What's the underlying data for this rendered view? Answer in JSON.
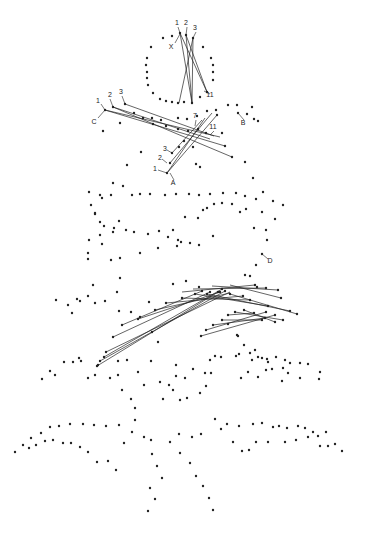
{
  "diagram": {
    "title": "",
    "width": 371,
    "height": 537,
    "colors": {
      "ink": "#222222",
      "background": "#ffffff"
    },
    "labels": [
      {
        "id": "label-1-top",
        "text": "1",
        "x": 177,
        "y": 25
      },
      {
        "id": "label-2-top",
        "text": "2",
        "x": 186,
        "y": 25
      },
      {
        "id": "label-3-top",
        "text": "3",
        "x": 195,
        "y": 30
      },
      {
        "id": "label-X",
        "text": "X",
        "x": 171,
        "y": 49
      },
      {
        "id": "label-11-top",
        "text": "11",
        "x": 210,
        "y": 97
      },
      {
        "id": "label-1-C",
        "text": "1",
        "x": 98,
        "y": 103
      },
      {
        "id": "label-2-C",
        "text": "2",
        "x": 110,
        "y": 97
      },
      {
        "id": "label-3-C",
        "text": "3",
        "x": 121,
        "y": 94
      },
      {
        "id": "label-C",
        "text": "C",
        "x": 94,
        "y": 124
      },
      {
        "id": "label-B",
        "text": "B",
        "x": 243,
        "y": 125
      },
      {
        "id": "label-7",
        "text": "7",
        "x": 195,
        "y": 118
      },
      {
        "id": "label-11-mid",
        "text": "11",
        "x": 213,
        "y": 129
      },
      {
        "id": "label-3-A",
        "text": "3",
        "x": 165,
        "y": 151
      },
      {
        "id": "label-2-A",
        "text": "2",
        "x": 160,
        "y": 160
      },
      {
        "id": "label-1-A",
        "text": "1",
        "x": 155,
        "y": 171
      },
      {
        "id": "label-A",
        "text": "A",
        "x": 173,
        "y": 185
      },
      {
        "id": "label-D",
        "text": "D",
        "x": 270,
        "y": 263
      }
    ],
    "leaders": [
      [
        178,
        27,
        180,
        33
      ],
      [
        187,
        27,
        186,
        35
      ],
      [
        196,
        32,
        193,
        38
      ],
      [
        175,
        43,
        180,
        34
      ],
      [
        210,
        94,
        204,
        91
      ],
      [
        101,
        104,
        105,
        110
      ],
      [
        110,
        99,
        113,
        107
      ],
      [
        122,
        96,
        125,
        104
      ],
      [
        98,
        118,
        105,
        110
      ],
      [
        244,
        120,
        238,
        113
      ],
      [
        196,
        120,
        195,
        126
      ],
      [
        214,
        131,
        210,
        135
      ],
      [
        167,
        150,
        172,
        153
      ],
      [
        162,
        159,
        167,
        163
      ],
      [
        158,
        170,
        167,
        173
      ],
      [
        174,
        180,
        170,
        173
      ],
      [
        268,
        259,
        262,
        254
      ]
    ],
    "threads": [
      [
        180,
        33,
        207,
        92
      ],
      [
        180,
        33,
        192,
        103
      ],
      [
        186,
        35,
        192,
        103
      ],
      [
        193,
        38,
        192,
        103
      ],
      [
        186,
        35,
        207,
        92
      ],
      [
        193,
        38,
        179,
        103
      ],
      [
        105,
        110,
        225,
        146
      ],
      [
        113,
        107,
        232,
        157
      ],
      [
        125,
        104,
        214,
        136
      ],
      [
        105,
        110,
        220,
        137
      ],
      [
        113,
        107,
        210,
        139
      ],
      [
        167,
        173,
        217,
        115
      ],
      [
        167,
        173,
        205,
        118
      ],
      [
        170,
        163,
        212,
        113
      ],
      [
        172,
        153,
        202,
        120
      ],
      [
        97,
        366,
        218,
        292
      ],
      [
        100,
        361,
        225,
        291
      ],
      [
        104,
        357,
        222,
        289
      ],
      [
        106,
        352,
        230,
        292
      ],
      [
        113,
        337,
        210,
        292
      ],
      [
        122,
        325,
        202,
        291
      ],
      [
        138,
        319,
        220,
        292
      ],
      [
        155,
        310,
        230,
        293
      ],
      [
        166,
        303,
        243,
        296
      ],
      [
        182,
        298,
        250,
        300
      ],
      [
        195,
        294,
        268,
        306
      ],
      [
        207,
        294,
        290,
        311
      ],
      [
        230,
        294,
        297,
        314
      ],
      [
        182,
        292,
        255,
        285
      ],
      [
        193,
        289,
        266,
        288
      ],
      [
        212,
        286,
        278,
        290
      ],
      [
        230,
        285,
        281,
        298
      ],
      [
        201,
        336,
        275,
        315
      ],
      [
        206,
        330,
        266,
        312
      ],
      [
        213,
        325,
        265,
        318
      ],
      [
        222,
        320,
        262,
        320
      ],
      [
        228,
        315,
        254,
        313
      ],
      [
        235,
        312,
        283,
        320
      ],
      [
        244,
        310,
        275,
        322
      ]
    ],
    "dots": [
      [
        180,
        33
      ],
      [
        186,
        35
      ],
      [
        193,
        38
      ],
      [
        163,
        38
      ],
      [
        172,
        36
      ],
      [
        203,
        47
      ],
      [
        151,
        47
      ],
      [
        147,
        58
      ],
      [
        146,
        65
      ],
      [
        147,
        72
      ],
      [
        147,
        78
      ],
      [
        148,
        85
      ],
      [
        211,
        58
      ],
      [
        213,
        65
      ],
      [
        213,
        72
      ],
      [
        213,
        80
      ],
      [
        153,
        93
      ],
      [
        160,
        99
      ],
      [
        166,
        101
      ],
      [
        172,
        102
      ],
      [
        178,
        103
      ],
      [
        184,
        102
      ],
      [
        192,
        103
      ],
      [
        200,
        97
      ],
      [
        207,
        92
      ],
      [
        105,
        110
      ],
      [
        113,
        107
      ],
      [
        125,
        104
      ],
      [
        134,
        113
      ],
      [
        143,
        118
      ],
      [
        152,
        118
      ],
      [
        161,
        120
      ],
      [
        178,
        118
      ],
      [
        187,
        119
      ],
      [
        197,
        116
      ],
      [
        207,
        111
      ],
      [
        216,
        110
      ],
      [
        228,
        105
      ],
      [
        238,
        113
      ],
      [
        247,
        114
      ],
      [
        254,
        119
      ],
      [
        258,
        121
      ],
      [
        237,
        105
      ],
      [
        252,
        107
      ],
      [
        153,
        124
      ],
      [
        166,
        126
      ],
      [
        188,
        131
      ],
      [
        198,
        129
      ],
      [
        217,
        115
      ],
      [
        225,
        146
      ],
      [
        232,
        157
      ],
      [
        120,
        123
      ],
      [
        103,
        131
      ],
      [
        178,
        129
      ],
      [
        206,
        133
      ],
      [
        222,
        133
      ],
      [
        141,
        152
      ],
      [
        127,
        165
      ],
      [
        113,
        183
      ],
      [
        102,
        198
      ],
      [
        95,
        214
      ],
      [
        245,
        162
      ],
      [
        253,
        178
      ],
      [
        263,
        192
      ],
      [
        167,
        173
      ],
      [
        170,
        163
      ],
      [
        172,
        153
      ],
      [
        179,
        147
      ],
      [
        184,
        141
      ],
      [
        193,
        147
      ],
      [
        196,
        164
      ],
      [
        200,
        167
      ],
      [
        123,
        186
      ],
      [
        89,
        192
      ],
      [
        91,
        205
      ],
      [
        100,
        195
      ],
      [
        111,
        195
      ],
      [
        132,
        195
      ],
      [
        140,
        194
      ],
      [
        150,
        194
      ],
      [
        165,
        195
      ],
      [
        176,
        194
      ],
      [
        189,
        194
      ],
      [
        199,
        195
      ],
      [
        210,
        194
      ],
      [
        223,
        193
      ],
      [
        236,
        193
      ],
      [
        245,
        196
      ],
      [
        256,
        199
      ],
      [
        273,
        201
      ],
      [
        283,
        205
      ],
      [
        95,
        213
      ],
      [
        119,
        221
      ],
      [
        114,
        228
      ],
      [
        100,
        222
      ],
      [
        104,
        226
      ],
      [
        113,
        232
      ],
      [
        126,
        230
      ],
      [
        134,
        232
      ],
      [
        148,
        234
      ],
      [
        159,
        231
      ],
      [
        168,
        237
      ],
      [
        181,
        242
      ],
      [
        185,
        217
      ],
      [
        198,
        218
      ],
      [
        203,
        210
      ],
      [
        207,
        208
      ],
      [
        214,
        204
      ],
      [
        222,
        203
      ],
      [
        232,
        204
      ],
      [
        240,
        212
      ],
      [
        246,
        209
      ],
      [
        213,
        236
      ],
      [
        199,
        245
      ],
      [
        190,
        243
      ],
      [
        178,
        240
      ],
      [
        173,
        230
      ],
      [
        262,
        212
      ],
      [
        266,
        230
      ],
      [
        267,
        240
      ],
      [
        254,
        228
      ],
      [
        275,
        219
      ],
      [
        100,
        235
      ],
      [
        102,
        244
      ],
      [
        111,
        260
      ],
      [
        120,
        258
      ],
      [
        140,
        253
      ],
      [
        158,
        248
      ],
      [
        177,
        246
      ],
      [
        89,
        240
      ],
      [
        88,
        253
      ],
      [
        88,
        259
      ],
      [
        262,
        254
      ],
      [
        256,
        265
      ],
      [
        250,
        276
      ],
      [
        245,
        275
      ],
      [
        257,
        287
      ],
      [
        119,
        311
      ],
      [
        131,
        312
      ],
      [
        140,
        317
      ],
      [
        149,
        302
      ],
      [
        173,
        284
      ],
      [
        186,
        281
      ],
      [
        199,
        287
      ],
      [
        120,
        278
      ],
      [
        93,
        285
      ],
      [
        88,
        296
      ],
      [
        77,
        299
      ],
      [
        72,
        313
      ],
      [
        80,
        301
      ],
      [
        56,
        300
      ],
      [
        68,
        305
      ],
      [
        105,
        301
      ],
      [
        117,
        292
      ],
      [
        95,
        303
      ],
      [
        97,
        366
      ],
      [
        100,
        361
      ],
      [
        104,
        357
      ],
      [
        106,
        352
      ],
      [
        113,
        337
      ],
      [
        122,
        325
      ],
      [
        138,
        319
      ],
      [
        155,
        310
      ],
      [
        166,
        303
      ],
      [
        182,
        298
      ],
      [
        195,
        294
      ],
      [
        207,
        294
      ],
      [
        230,
        294
      ],
      [
        218,
        292
      ],
      [
        225,
        291
      ],
      [
        222,
        289
      ],
      [
        210,
        292
      ],
      [
        202,
        291
      ],
      [
        220,
        292
      ],
      [
        243,
        296
      ],
      [
        250,
        300
      ],
      [
        268,
        306
      ],
      [
        290,
        311
      ],
      [
        297,
        314
      ],
      [
        255,
        285
      ],
      [
        266,
        288
      ],
      [
        278,
        290
      ],
      [
        281,
        298
      ],
      [
        201,
        336
      ],
      [
        206,
        330
      ],
      [
        213,
        325
      ],
      [
        222,
        320
      ],
      [
        228,
        315
      ],
      [
        235,
        312
      ],
      [
        244,
        310
      ],
      [
        275,
        315
      ],
      [
        266,
        312
      ],
      [
        265,
        318
      ],
      [
        262,
        320
      ],
      [
        254,
        313
      ],
      [
        283,
        320
      ],
      [
        275,
        322
      ],
      [
        152,
        332
      ],
      [
        158,
        342
      ],
      [
        228,
        324
      ],
      [
        237,
        335
      ],
      [
        244,
        345
      ],
      [
        250,
        353
      ],
      [
        252,
        360
      ],
      [
        255,
        350
      ],
      [
        239,
        354
      ],
      [
        262,
        358
      ],
      [
        238,
        336
      ],
      [
        258,
        377
      ],
      [
        285,
        360
      ],
      [
        267,
        359
      ],
      [
        276,
        357
      ],
      [
        290,
        363
      ],
      [
        288,
        373
      ],
      [
        300,
        363
      ],
      [
        308,
        364
      ],
      [
        319,
        379
      ],
      [
        88,
        378
      ],
      [
        98,
        365
      ],
      [
        118,
        361
      ],
      [
        127,
        360
      ],
      [
        151,
        361
      ],
      [
        176,
        365
      ],
      [
        205,
        373
      ],
      [
        42,
        379
      ],
      [
        50,
        371
      ],
      [
        55,
        375
      ],
      [
        64,
        362
      ],
      [
        73,
        362
      ],
      [
        81,
        361
      ],
      [
        95,
        375
      ],
      [
        118,
        375
      ],
      [
        138,
        372
      ],
      [
        110,
        378
      ],
      [
        122,
        390
      ],
      [
        131,
        399
      ],
      [
        135,
        408
      ],
      [
        79,
        358
      ],
      [
        144,
        385
      ],
      [
        160,
        382
      ],
      [
        173,
        390
      ],
      [
        180,
        400
      ],
      [
        163,
        399
      ],
      [
        169,
        385
      ],
      [
        176,
        376
      ],
      [
        185,
        378
      ],
      [
        193,
        369
      ],
      [
        210,
        360
      ],
      [
        221,
        357
      ],
      [
        236,
        356
      ],
      [
        258,
        357
      ],
      [
        268,
        362
      ],
      [
        272,
        369
      ],
      [
        187,
        398
      ],
      [
        200,
        393
      ],
      [
        206,
        386
      ],
      [
        211,
        373
      ],
      [
        215,
        356
      ],
      [
        241,
        378
      ],
      [
        248,
        372
      ],
      [
        266,
        370
      ],
      [
        283,
        368
      ],
      [
        282,
        381
      ],
      [
        300,
        378
      ],
      [
        320,
        372
      ],
      [
        15,
        452
      ],
      [
        23,
        445
      ],
      [
        29,
        448
      ],
      [
        31,
        438
      ],
      [
        36,
        445
      ],
      [
        41,
        433
      ],
      [
        45,
        441
      ],
      [
        50,
        427
      ],
      [
        53,
        440
      ],
      [
        59,
        426
      ],
      [
        63,
        443
      ],
      [
        70,
        424
      ],
      [
        71,
        443
      ],
      [
        83,
        424
      ],
      [
        80,
        447
      ],
      [
        94,
        425
      ],
      [
        88,
        452
      ],
      [
        106,
        426
      ],
      [
        97,
        462
      ],
      [
        108,
        461
      ],
      [
        116,
        470
      ],
      [
        119,
        425
      ],
      [
        124,
        443
      ],
      [
        132,
        432
      ],
      [
        135,
        420
      ],
      [
        144,
        437
      ],
      [
        151,
        440
      ],
      [
        152,
        454
      ],
      [
        157,
        466
      ],
      [
        162,
        478
      ],
      [
        150,
        488
      ],
      [
        155,
        499
      ],
      [
        148,
        511
      ],
      [
        180,
        453
      ],
      [
        190,
        463
      ],
      [
        196,
        476
      ],
      [
        203,
        486
      ],
      [
        209,
        498
      ],
      [
        213,
        510
      ],
      [
        170,
        442
      ],
      [
        179,
        434
      ],
      [
        192,
        437
      ],
      [
        201,
        434
      ],
      [
        215,
        419
      ],
      [
        221,
        429
      ],
      [
        227,
        424
      ],
      [
        233,
        442
      ],
      [
        239,
        426
      ],
      [
        242,
        451
      ],
      [
        249,
        450
      ],
      [
        253,
        424
      ],
      [
        256,
        442
      ],
      [
        262,
        423
      ],
      [
        268,
        442
      ],
      [
        273,
        427
      ],
      [
        279,
        426
      ],
      [
        285,
        442
      ],
      [
        287,
        428
      ],
      [
        296,
        440
      ],
      [
        298,
        426
      ],
      [
        305,
        428
      ],
      [
        308,
        437
      ],
      [
        313,
        432
      ],
      [
        318,
        436
      ],
      [
        320,
        446
      ],
      [
        326,
        432
      ],
      [
        328,
        446
      ],
      [
        335,
        444
      ],
      [
        342,
        451
      ]
    ]
  }
}
